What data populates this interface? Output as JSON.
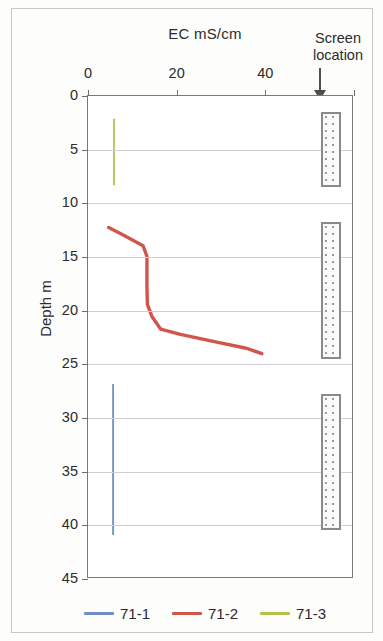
{
  "figure": {
    "background_color": "#fdfdfc",
    "frame_color": "#7a7a7a"
  },
  "top_axis_title": "EC mS/cm",
  "screen_annotation": {
    "line1": "Screen",
    "line2": "location",
    "arrow": "down-arrow"
  },
  "y_axis_title": "Depth  m",
  "legend": {
    "items": [
      {
        "label": "71-1",
        "color": "#6f8fc4"
      },
      {
        "label": "71-2",
        "color": "#d0554a"
      },
      {
        "label": "71-3",
        "color": "#b5c24a"
      }
    ]
  },
  "chart_data": {
    "type": "line",
    "title": "EC mS/cm",
    "xlabel": "EC mS/cm",
    "ylabel": "Depth  m",
    "orientation": "vertical-profile",
    "xlim": [
      0,
      60
    ],
    "ylim": [
      0,
      45
    ],
    "y_inverted": true,
    "xticks": [
      0,
      20,
      40,
      60
    ],
    "xtick_labels": [
      "0",
      "20",
      "40",
      ""
    ],
    "yticks": [
      0,
      5,
      10,
      15,
      20,
      25,
      30,
      35,
      40,
      45
    ],
    "ytick_labels": [
      "0",
      "5",
      "10",
      "15",
      "20",
      "25",
      "30",
      "35",
      "40",
      "45"
    ],
    "grid": "horizontal",
    "legend_position": "bottom",
    "series": [
      {
        "name": "71-1",
        "color": "#6f8fc4",
        "points": [
          {
            "ec": 5.7,
            "depth": 27.0
          },
          {
            "ec": 5.7,
            "depth": 41.0
          }
        ]
      },
      {
        "name": "71-2",
        "color": "#d0554a",
        "points": [
          {
            "ec": 4.7,
            "depth": 12.3
          },
          {
            "ec": 8.0,
            "depth": 13.0
          },
          {
            "ec": 12.5,
            "depth": 14.0
          },
          {
            "ec": 13.4,
            "depth": 15.0
          },
          {
            "ec": 13.4,
            "depth": 18.0
          },
          {
            "ec": 13.5,
            "depth": 19.5
          },
          {
            "ec": 14.5,
            "depth": 20.6
          },
          {
            "ec": 16.5,
            "depth": 21.8
          },
          {
            "ec": 21.0,
            "depth": 22.3
          },
          {
            "ec": 29.0,
            "depth": 23.0
          },
          {
            "ec": 36.0,
            "depth": 23.6
          },
          {
            "ec": 39.5,
            "depth": 24.1
          }
        ]
      },
      {
        "name": "71-3",
        "color": "#b5c24a",
        "points": [
          {
            "ec": 5.9,
            "depth": 2.2
          },
          {
            "ec": 5.9,
            "depth": 8.3
          }
        ]
      }
    ],
    "screen_locations": [
      {
        "well": "71-3",
        "depth_top": 1.5,
        "depth_bottom": 8.5
      },
      {
        "well": "71-2",
        "depth_top": 11.7,
        "depth_bottom": 24.5
      },
      {
        "well": "71-1",
        "depth_top": 27.8,
        "depth_bottom": 40.4
      }
    ]
  }
}
